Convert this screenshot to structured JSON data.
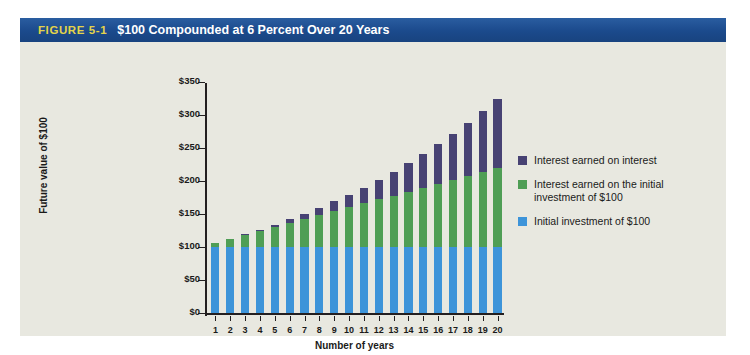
{
  "figure": {
    "number": "FIGURE 5-1",
    "title": "$100 Compounded at 6 Percent Over 20 Years"
  },
  "colors": {
    "header_bar": "#1f4f8f",
    "figure_number": "#e4d44a",
    "panel_bg": "#e8e8e0",
    "initial_investment": "#3d94d9",
    "simple_interest": "#4f9e55",
    "interest_on_interest": "#474273"
  },
  "chart_data": {
    "type": "bar",
    "stacked": true,
    "title": "$100 Compounded at 6 Percent Over 20 Years",
    "xlabel": "Number of years",
    "ylabel": "Future value of $100",
    "categories": [
      "1",
      "2",
      "3",
      "4",
      "5",
      "6",
      "7",
      "8",
      "9",
      "10",
      "11",
      "12",
      "13",
      "14",
      "15",
      "16",
      "17",
      "18",
      "19",
      "20"
    ],
    "ylim": [
      0,
      350
    ],
    "yticks": [
      0,
      50,
      100,
      150,
      200,
      250,
      300,
      350
    ],
    "ytick_labels": [
      "$0",
      "$50",
      "$100",
      "$150",
      "$200",
      "$250",
      "$300",
      "$350"
    ],
    "grid": false,
    "legend_position": "right",
    "series": [
      {
        "name": "Initial investment of $100",
        "color": "#3d94d9",
        "values": [
          100,
          100,
          100,
          100,
          100,
          100,
          100,
          100,
          100,
          100,
          100,
          100,
          100,
          100,
          100,
          100,
          100,
          100,
          100,
          100
        ]
      },
      {
        "name": "Interest earned on the initial investment of $100",
        "color": "#4f9e55",
        "values": [
          6,
          12,
          18,
          24,
          30,
          36,
          42,
          48,
          54,
          60,
          66,
          72,
          78,
          84,
          90,
          96,
          102,
          108,
          114,
          120
        ]
      },
      {
        "name": "Interest earned on interest",
        "color": "#474273",
        "values": [
          0,
          0.4,
          1.1,
          2.2,
          3.8,
          5.9,
          8.4,
          11.4,
          15.0,
          19.2,
          24.0,
          29.5,
          35.8,
          42.8,
          50.7,
          59.4,
          69.1,
          79.8,
          91.6,
          104.6
        ]
      }
    ],
    "totals": [
      106.0,
      112.4,
      119.1,
      126.2,
      133.8,
      141.9,
      150.4,
      159.4,
      169.0,
      179.2,
      190.0,
      201.5,
      213.8,
      226.8,
      240.7,
      255.4,
      271.1,
      287.8,
      305.6,
      324.3
    ]
  },
  "legend": {
    "entries": [
      {
        "label": "Interest earned on interest",
        "color": "#474273"
      },
      {
        "label": "Interest earned on the initial investment of $100",
        "color": "#4f9e55"
      },
      {
        "label": "Initial investment of $100",
        "color": "#3d94d9"
      }
    ]
  }
}
